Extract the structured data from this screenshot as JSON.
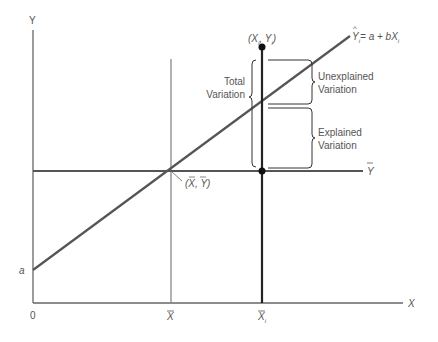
{
  "diagram": {
    "axes": {
      "y_label": "Y",
      "x_label": "X",
      "origin_label": "0",
      "intercept_label": "a"
    },
    "ticks": {
      "xbar_label": "X",
      "xi_label": "X",
      "xi_sub": "i"
    },
    "lines": {
      "regression_label_yhat": "Y",
      "regression_label_yhat_sub": "i",
      "regression_label_rhs": "= a + bX",
      "regression_label_rhs_sub": "i",
      "mean_line_label": "Y"
    },
    "points": {
      "observation_label": "(X",
      "observation_label_sub1": "i",
      "observation_label_mid": ", Y",
      "observation_label_sub2": "i",
      "observation_label_end": ")",
      "mean_point_label": "(X, Y)"
    },
    "annotations": {
      "total_line1": "Total",
      "total_line2": "Variation",
      "unexplained_line1": "Unexplained",
      "unexplained_line2": "Variation",
      "explained_line1": "Explained",
      "explained_line2": "Variation"
    },
    "colors": {
      "axis": "#555555",
      "regression": "#555555",
      "mean_lines": "#777777",
      "xi_line": "#222222",
      "brackets": "#333333",
      "text": "#555555"
    }
  }
}
